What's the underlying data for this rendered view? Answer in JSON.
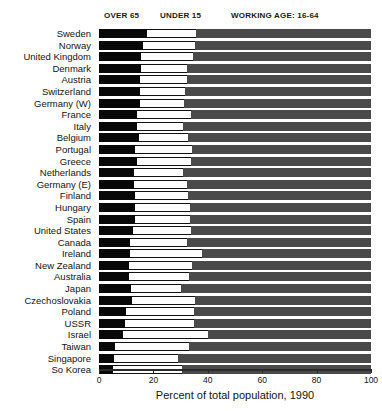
{
  "legend": {
    "over65": "OVER 65",
    "under15": "UNDER 15",
    "working": "WORKING AGE: 16-64"
  },
  "axis": {
    "title": "Percent of total population, 1990",
    "ticks": [
      "0",
      "20",
      "40",
      "60",
      "80",
      "100"
    ]
  },
  "colors": {
    "over65": "#080808",
    "under15": "#fdfdfd",
    "working": "#4a4a4a",
    "background": "#ffffff",
    "text": "#141414"
  },
  "chart_data": {
    "type": "bar",
    "orientation": "horizontal",
    "stacked": true,
    "title": "",
    "xlabel": "Percent of total population, 1990",
    "ylabel": "",
    "xlim": [
      0,
      100
    ],
    "xticks": [
      0,
      20,
      40,
      60,
      80,
      100
    ],
    "grid": false,
    "legend_position": "top",
    "categories": [
      "Sweden",
      "Norway",
      "United Kingdom",
      "Denmark",
      "Austria",
      "Switzerland",
      "Germany (W)",
      "France",
      "Italy",
      "Belgium",
      "Portugal",
      "Greece",
      "Netherlands",
      "Germany (E)",
      "Finland",
      "Hungary",
      "Spain",
      "United States",
      "Canada",
      "Ireland",
      "New Zealand",
      "Australia",
      "Japan",
      "Czechoslovakia",
      "Poland",
      "USSR",
      "Israel",
      "Taiwan",
      "Singapore",
      "So Korea"
    ],
    "series": [
      {
        "name": "OVER 65",
        "values": [
          17.8,
          16.3,
          15.6,
          15.4,
          15.0,
          15.0,
          15.2,
          14.0,
          14.0,
          14.8,
          13.2,
          13.8,
          12.7,
          13.0,
          13.3,
          13.2,
          13.4,
          12.4,
          11.5,
          11.3,
          11.1,
          11.1,
          11.7,
          12.2,
          10.0,
          9.5,
          9.0,
          6.0,
          5.6,
          5.0
        ]
      },
      {
        "name": "UNDER 15",
        "values": [
          17.8,
          19.0,
          19.0,
          17.0,
          17.4,
          16.8,
          16.0,
          20.0,
          17.0,
          18.0,
          21.0,
          20.0,
          18.3,
          19.5,
          19.4,
          20.4,
          20.0,
          21.3,
          21.0,
          26.5,
          23.1,
          22.0,
          18.5,
          23.0,
          25.0,
          25.5,
          31.0,
          27.0,
          23.4,
          25.5
        ]
      },
      {
        "name": "WORKING AGE: 16-64",
        "values": [
          64.4,
          64.7,
          65.4,
          67.6,
          67.6,
          68.2,
          68.8,
          66.0,
          69.0,
          67.2,
          65.8,
          66.2,
          69.0,
          67.5,
          67.3,
          66.4,
          66.6,
          66.3,
          67.5,
          62.2,
          65.8,
          66.9,
          69.8,
          64.8,
          65.0,
          65.0,
          60.0,
          67.0,
          71.0,
          69.5
        ]
      }
    ]
  }
}
